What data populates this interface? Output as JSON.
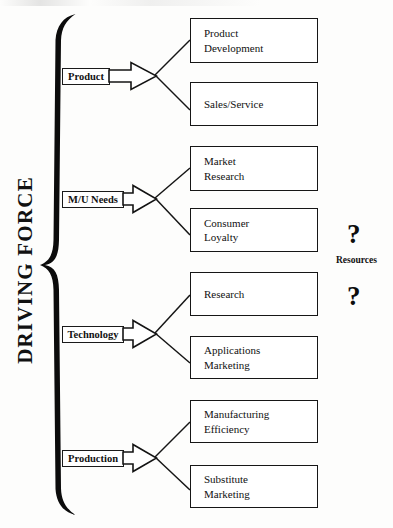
{
  "diagram": {
    "title": "DRIVING FORCE",
    "brace_name": "driving-force-brace",
    "resources_label": "Resources",
    "question_mark": "?",
    "drivers": [
      {
        "label": "Product",
        "top": 68,
        "left": 62,
        "width": 48,
        "arrow_top": 61,
        "outcomes": [
          0,
          1
        ]
      },
      {
        "label": "M/U Needs",
        "top": 191,
        "left": 62,
        "width": 62,
        "arrow_top": 184,
        "outcomes": [
          2,
          3
        ]
      },
      {
        "label": "Technology",
        "top": 326,
        "left": 62,
        "width": 62,
        "arrow_top": 319,
        "outcomes": [
          4,
          5
        ]
      },
      {
        "label": "Production",
        "top": 450,
        "left": 62,
        "width": 62,
        "arrow_top": 443,
        "outcomes": [
          6,
          7
        ]
      }
    ],
    "outcomes": [
      {
        "line1": "Product",
        "line2": "Development",
        "top": 18,
        "height": 45
      },
      {
        "line1": "Sales/Service",
        "line2": "",
        "top": 82,
        "height": 44
      },
      {
        "line1": "Market",
        "line2": "Research",
        "top": 146,
        "height": 45
      },
      {
        "line1": "Consumer",
        "line2": "Loyalty",
        "top": 208,
        "height": 44
      },
      {
        "line1": "Research",
        "line2": "",
        "top": 272,
        "height": 44
      },
      {
        "line1": "Applications",
        "line2": "Marketing",
        "top": 336,
        "height": 43
      },
      {
        "line1": "Manufacturing",
        "line2": "Efficiency",
        "top": 400,
        "height": 43
      },
      {
        "line1": "Substitute",
        "line2": "Marketing",
        "top": 465,
        "height": 43
      }
    ],
    "colors": {
      "ink": "#111111",
      "box_border": "#161616",
      "paper": "#fdfdfc"
    }
  }
}
